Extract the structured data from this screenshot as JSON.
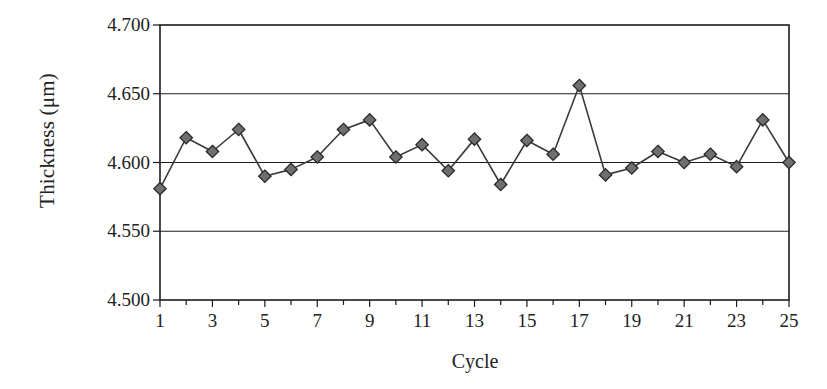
{
  "chart_data": {
    "type": "line",
    "title": "",
    "xlabel": "Cycle",
    "ylabel": "Thickness (μm)",
    "xlim": [
      1,
      25
    ],
    "ylim": [
      4.5,
      4.7
    ],
    "ytick_labels": [
      "4.700",
      "4.650",
      "4.600",
      "4.550",
      "4.500"
    ],
    "ytick_values": [
      4.7,
      4.65,
      4.6,
      4.55,
      4.5
    ],
    "xtick_labels": [
      "1",
      "3",
      "5",
      "7",
      "9",
      "11",
      "13",
      "15",
      "17",
      "19",
      "21",
      "23",
      "25"
    ],
    "xtick_values": [
      1,
      3,
      5,
      7,
      9,
      11,
      13,
      15,
      17,
      19,
      21,
      23,
      25
    ],
    "minor_xticks": [
      2,
      4,
      6,
      8,
      10,
      12,
      14,
      16,
      18,
      20,
      22,
      24
    ],
    "grid": "horizontal",
    "legend": "none",
    "marker": "diamond",
    "marker_fill": "#6f6f6f",
    "marker_edge": "#2a2a2a",
    "line_color": "#3a3a3a",
    "axis_color": "#1c1c1c",
    "background": "#ffffff",
    "categories": [
      1,
      2,
      3,
      4,
      5,
      6,
      7,
      8,
      9,
      10,
      11,
      12,
      13,
      14,
      15,
      16,
      17,
      18,
      19,
      20,
      21,
      22,
      23,
      24,
      25
    ],
    "values": [
      4.581,
      4.618,
      4.608,
      4.624,
      4.59,
      4.595,
      4.604,
      4.624,
      4.631,
      4.604,
      4.613,
      4.594,
      4.617,
      4.584,
      4.616,
      4.606,
      4.656,
      4.591,
      4.596,
      4.608,
      4.6,
      4.606,
      4.597,
      4.631,
      4.6
    ],
    "series": [
      {
        "name": "Thickness",
        "values": [
          4.581,
          4.618,
          4.608,
          4.624,
          4.59,
          4.595,
          4.604,
          4.624,
          4.631,
          4.604,
          4.613,
          4.594,
          4.617,
          4.584,
          4.616,
          4.606,
          4.656,
          4.591,
          4.596,
          4.608,
          4.6,
          4.606,
          4.597,
          4.631,
          4.6
        ]
      }
    ]
  }
}
